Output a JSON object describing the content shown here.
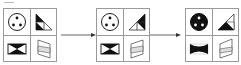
{
  "figure": {
    "colors": {
      "border": "#9a9a9a",
      "fill": "#111111",
      "light": "#dddddd",
      "background": "#ffffff"
    },
    "panels": [
      {
        "index": 1,
        "cells": [
          {
            "position": "top-left",
            "shape": "circle-three-dots",
            "fill": "white"
          },
          {
            "position": "top-right",
            "shape": "split-triangle",
            "fill": "black-top"
          },
          {
            "position": "bottom-left",
            "shape": "bowtie-rectangle",
            "fill": "black"
          },
          {
            "position": "bottom-right",
            "shape": "trapezoid-striped",
            "fill": "light"
          }
        ]
      },
      {
        "index": 2,
        "cells": [
          {
            "position": "top-left",
            "shape": "circle-three-dots",
            "fill": "white"
          },
          {
            "position": "top-right",
            "shape": "split-triangle",
            "fill": "black-right"
          },
          {
            "position": "bottom-left",
            "shape": "bowtie-rectangle",
            "fill": "black"
          },
          {
            "position": "bottom-right",
            "shape": "trapezoid-striped",
            "fill": "light"
          }
        ]
      },
      {
        "index": 3,
        "cells": [
          {
            "position": "top-left",
            "shape": "circle-three-dots",
            "fill": "black"
          },
          {
            "position": "top-right",
            "shape": "split-triangle",
            "fill": "black-bottom"
          },
          {
            "position": "bottom-left",
            "shape": "bowtie-rectangle",
            "fill": "black-rounded"
          },
          {
            "position": "bottom-right",
            "shape": "trapezoid-striped",
            "fill": "light"
          }
        ]
      }
    ],
    "arrows": [
      {
        "from": 1,
        "to": 2
      },
      {
        "from": 2,
        "to": 3
      }
    ]
  }
}
